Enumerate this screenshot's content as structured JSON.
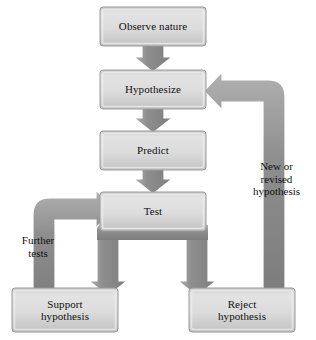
{
  "diagram": {
    "type": "flowchart",
    "palette": {
      "box_fill_light": "#d7d7d7",
      "box_fill_dark": "#bdbdbd",
      "box_highlight": "#e4e4e4",
      "box_border": "#9a9a9a",
      "arrow_fill": "#8f8f8f",
      "arrow_fill_light": "#a8a8a8",
      "arrow_outline": "#ffffff",
      "text": "#111111",
      "background": "#ffffff"
    },
    "nodes": [
      {
        "id": "observe",
        "label": "Observe nature",
        "x": 100,
        "y": 7,
        "w": 106,
        "h": 39
      },
      {
        "id": "hypothesize",
        "label": "Hypothesize",
        "x": 100,
        "y": 70,
        "w": 106,
        "h": 39
      },
      {
        "id": "predict",
        "label": "Predict",
        "x": 100,
        "y": 131,
        "w": 106,
        "h": 39
      },
      {
        "id": "test",
        "label": "Test",
        "x": 100,
        "y": 192,
        "w": 106,
        "h": 39
      },
      {
        "id": "support",
        "label": "Support\nhypothesis",
        "x": 12,
        "y": 288,
        "w": 106,
        "h": 44
      },
      {
        "id": "reject",
        "label": "Reject\nhypothesis",
        "x": 189,
        "y": 288,
        "w": 106,
        "h": 44
      }
    ],
    "edges": [
      {
        "id": "observe-to-hypothesize",
        "from": "observe",
        "to": "hypothesize",
        "label": ""
      },
      {
        "id": "hypothesize-to-predict",
        "from": "hypothesize",
        "to": "predict",
        "label": ""
      },
      {
        "id": "predict-to-test",
        "from": "predict",
        "to": "test",
        "label": ""
      },
      {
        "id": "test-to-support",
        "from": "test",
        "to": "support",
        "label": ""
      },
      {
        "id": "test-to-reject",
        "from": "test",
        "to": "reject",
        "label": ""
      },
      {
        "id": "support-to-test",
        "from": "support",
        "to": "test",
        "label": "Further\ntests"
      },
      {
        "id": "reject-to-hypothesize",
        "from": "reject",
        "to": "hypothesize",
        "label": "New or\nrevised\nhypothesis"
      }
    ],
    "edge_labels": {
      "further_tests": "Further\ntests",
      "new_or_revised": "New or\nrevised\nhypothesis"
    }
  }
}
